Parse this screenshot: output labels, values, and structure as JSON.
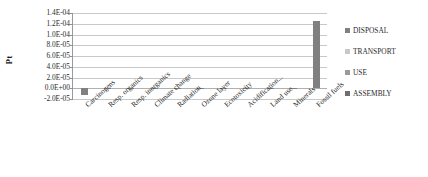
{
  "chart_data": {
    "type": "bar",
    "title": "",
    "subtitle": "",
    "xlabel": "",
    "ylabel": "Pt",
    "ylim": [
      -2e-05,
      0.00014
    ],
    "grid": true,
    "legend_position": "right",
    "stacked": true,
    "categories": [
      "Carcinogens",
      "Resp. organics",
      "Resp. inorganics",
      "Climate change",
      "Radiation",
      "Ozone layer",
      "Ecotoxicity",
      "Acidification...",
      "Land use",
      "Minerals",
      "Fossil fuels"
    ],
    "ytick_labels": [
      "1.4E-04",
      "1.2E-04",
      "1.0E-04",
      "8.0E-05",
      "6.0E-05",
      "4.0E-05",
      "2.0E-05",
      "0.0E+00",
      "-2.0E-05"
    ],
    "ytick_values": [
      0.00014,
      0.00012,
      0.0001,
      8e-05,
      6e-05,
      4e-05,
      2e-05,
      0.0,
      -2e-05
    ],
    "series": [
      {
        "name": "DISPOSAL",
        "color": "#808080",
        "values": [
          -1.2e-05,
          4e-07,
          1e-06,
          8e-07,
          3e-07,
          2e-07,
          6e-07,
          4e-07,
          3e-07,
          5e-07,
          0.000125
        ]
      },
      {
        "name": "TRANSPORT",
        "color": "#c0c0c0",
        "values": [
          0,
          0,
          0,
          0,
          0,
          0,
          0,
          0,
          0,
          0,
          0
        ]
      },
      {
        "name": "USE",
        "color": "#9a9a9a",
        "values": [
          0,
          0,
          0,
          0,
          0,
          0,
          0,
          0,
          0,
          0,
          0
        ]
      },
      {
        "name": "ASSEMBLY",
        "color": "#6e6e6e",
        "values": [
          0,
          0,
          0,
          0,
          0,
          0,
          0,
          0,
          0,
          0,
          0
        ]
      }
    ],
    "bar_totals": [
      -1.2e-05,
      4e-07,
      1e-06,
      8e-07,
      3e-07,
      2e-07,
      6e-07,
      4e-07,
      3e-07,
      5e-07,
      0.000125
    ]
  },
  "legend": {
    "items": [
      {
        "label": "DISPOSAL",
        "color": "#808080"
      },
      {
        "label": "TRANSPORT",
        "color": "#c8c8c8"
      },
      {
        "label": "USE",
        "color": "#9a9a9a"
      },
      {
        "label": "ASSEMBLY",
        "color": "#6e6e6e"
      }
    ]
  },
  "axis": {
    "y_title": "Pt"
  }
}
